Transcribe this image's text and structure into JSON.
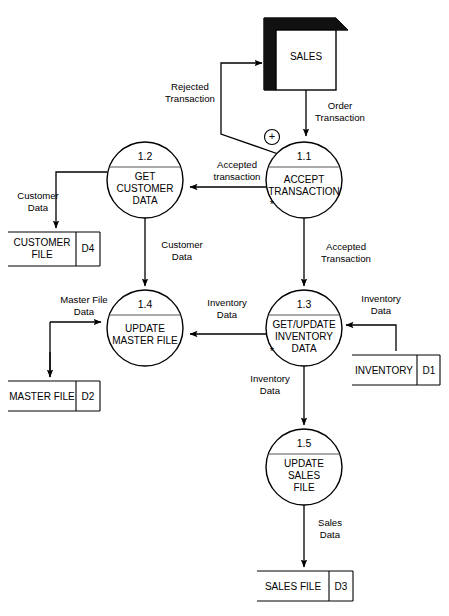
{
  "diagram": {
    "type": "data-flow-diagram",
    "title": "",
    "external_entities": [
      {
        "id": "sales-entity",
        "label": "SALES",
        "x": 300,
        "y": 50
      }
    ],
    "processes": [
      {
        "id": "1.1",
        "label_lines": [
          "ACCEPT",
          "TRANSACTION"
        ],
        "cx": 304,
        "cy": 180,
        "r": 38,
        "has_asterisk": true
      },
      {
        "id": "1.2",
        "label_lines": [
          "GET",
          "CUSTOMER",
          "DATA"
        ],
        "cx": 145,
        "cy": 180,
        "r": 38,
        "has_asterisk": false
      },
      {
        "id": "1.3",
        "label_lines": [
          "GET/UPDATE",
          "INVENTORY",
          "DATA"
        ],
        "cx": 304,
        "cy": 328,
        "r": 38,
        "has_asterisk": true
      },
      {
        "id": "1.4",
        "label_lines": [
          "UPDATE",
          "MASTER FILE"
        ],
        "cx": 145,
        "cy": 328,
        "r": 38,
        "has_asterisk": false
      },
      {
        "id": "1.5",
        "label_lines": [
          "UPDATE",
          "SALES",
          "FILE"
        ],
        "cx": 304,
        "cy": 467,
        "r": 38,
        "has_asterisk": false
      }
    ],
    "data_stores": [
      {
        "id": "D4",
        "label": "CUSTOMER FILE",
        "x": 8,
        "y": 232,
        "w": 92,
        "h": 34
      },
      {
        "id": "D2",
        "label": "MASTER FILE",
        "x": 8,
        "y": 381,
        "w": 92,
        "h": 30
      },
      {
        "id": "D1",
        "label": "INVENTORY",
        "x": 352,
        "y": 355,
        "w": 88,
        "h": 30
      },
      {
        "id": "D3",
        "label": "SALES FILE",
        "x": 257,
        "y": 571,
        "w": 96,
        "h": 30
      }
    ],
    "flows": [
      {
        "name": "order-transaction",
        "label": "Order\nTransaction",
        "from": "SALES",
        "to": "1.1"
      },
      {
        "name": "rejected-transaction",
        "label": "Rejected\nTransaction",
        "from": "1.1",
        "to": "SALES"
      },
      {
        "name": "accepted-transaction-to-12",
        "label": "Accepted\ntransaction",
        "from": "1.1",
        "to": "1.2"
      },
      {
        "name": "accepted-transaction-to-13",
        "label": "Accepted\nTransaction",
        "from": "1.1",
        "to": "1.3"
      },
      {
        "name": "customer-data-to-d4",
        "label": "Customer\nData",
        "from": "1.2",
        "to": "D4"
      },
      {
        "name": "customer-data-to-14",
        "label": "Customer\nData",
        "from": "1.2",
        "to": "1.4"
      },
      {
        "name": "master-file-data",
        "label": "Master File\nData",
        "from": "D2",
        "to": "1.4"
      },
      {
        "name": "inventory-data-13-to-14",
        "label": "Inventory\nData",
        "from": "1.3",
        "to": "1.4"
      },
      {
        "name": "inventory-data-d1-to-13",
        "label": "Inventory\nData",
        "from": "D1",
        "to": "1.3"
      },
      {
        "name": "inventory-data-to-15",
        "label": "Inventory\nData",
        "from": "1.3",
        "to": "1.5"
      },
      {
        "name": "sales-data",
        "label": "Sales\nData",
        "from": "1.5",
        "to": "D3"
      }
    ],
    "annotations": {
      "plus_symbol": "+",
      "asterisk_symbol": "*"
    }
  },
  "labels": {
    "sales_entity": "SALES",
    "proc_11_id": "1.1",
    "proc_11_l1": "ACCEPT",
    "proc_11_l2": "TRANSACTION",
    "proc_12_id": "1.2",
    "proc_12_l1": "GET",
    "proc_12_l2": "CUSTOMER",
    "proc_12_l3": "DATA",
    "proc_13_id": "1.3",
    "proc_13_l1": "GET/UPDATE",
    "proc_13_l2": "INVENTORY",
    "proc_13_l3": "DATA",
    "proc_14_id": "1.4",
    "proc_14_l1": "UPDATE",
    "proc_14_l2": "MASTER FILE",
    "proc_15_id": "1.5",
    "proc_15_l1": "UPDATE",
    "proc_15_l2": "SALES",
    "proc_15_l3": "FILE",
    "store_d4_label": "CUSTOMER",
    "store_d4_label2": "FILE",
    "store_d4_id": "D4",
    "store_d2_label": "MASTER FILE",
    "store_d2_id": "D2",
    "store_d1_label": "INVENTORY",
    "store_d1_id": "D1",
    "store_d3_label": "SALES FILE",
    "store_d3_id": "D3",
    "flow_order_l1": "Order",
    "flow_order_l2": "Transaction",
    "flow_rejected_l1": "Rejected",
    "flow_rejected_l2": "Transaction",
    "flow_accepted_lower_l1": "Accepted",
    "flow_accepted_lower_l2": "transaction",
    "flow_accepted_upper_l1": "Accepted",
    "flow_accepted_upper_l2": "Transaction",
    "flow_customer_d4_l1": "Customer",
    "flow_customer_d4_l2": "Data",
    "flow_customer_14_l1": "Customer",
    "flow_customer_14_l2": "Data",
    "flow_master_l1": "Master File",
    "flow_master_l2": "Data",
    "flow_inv_mid_l1": "Inventory",
    "flow_inv_mid_l2": "Data",
    "flow_inv_right_l1": "Inventory",
    "flow_inv_right_l2": "Data",
    "flow_inv_down_l1": "Inventory",
    "flow_inv_down_l2": "Data",
    "flow_sales_l1": "Sales",
    "flow_sales_l2": "Data",
    "plus": "+",
    "asterisk1": "*",
    "asterisk2": "*"
  },
  "colors": {
    "stroke": "#000000",
    "fill": "#ffffff",
    "entity_shadow": "#111111",
    "divider": "#555555"
  }
}
